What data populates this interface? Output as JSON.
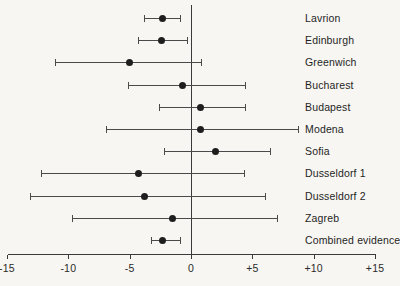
{
  "chart_data": {
    "type": "scatter",
    "subtype": "forest-plot",
    "title": "",
    "xlabel": "",
    "ylabel": "",
    "xlim": [
      -15,
      15
    ],
    "xticks": [
      -15,
      -10,
      -5,
      0,
      5,
      10,
      15
    ],
    "xtick_labels": [
      "-15",
      "-10",
      "-5",
      "0",
      "+5",
      "+10",
      "+15"
    ],
    "grid": false,
    "legend": null,
    "reference_line": 0,
    "categories": [
      "Lavrion",
      "Edinburgh",
      "Greenwich",
      "Bucharest",
      "Budapest",
      "Modena",
      "Sofia",
      "Dusseldorf 1",
      "Dusseldorf 2",
      "Zagreb",
      "Combined evidence"
    ],
    "points": [
      {
        "label": "Lavrion",
        "estimate": -2.3,
        "ci_low": -3.8,
        "ci_high": -0.9
      },
      {
        "label": "Edinburgh",
        "estimate": -2.4,
        "ci_low": -4.3,
        "ci_high": -0.3
      },
      {
        "label": "Greenwich",
        "estimate": -5.0,
        "ci_low": -11.1,
        "ci_high": 0.8
      },
      {
        "label": "Bucharest",
        "estimate": -0.7,
        "ci_low": -5.1,
        "ci_high": 4.4
      },
      {
        "label": "Budapest",
        "estimate": 0.8,
        "ci_low": -2.6,
        "ci_high": 4.4
      },
      {
        "label": "Modena",
        "estimate": 0.8,
        "ci_low": -6.9,
        "ci_high": 8.7
      },
      {
        "label": "Sofia",
        "estimate": 2.0,
        "ci_low": -2.2,
        "ci_high": 6.4
      },
      {
        "label": "Dusseldorf 1",
        "estimate": -4.3,
        "ci_low": -12.2,
        "ci_high": 4.3
      },
      {
        "label": "Dusseldorf 2",
        "estimate": -3.8,
        "ci_low": -13.1,
        "ci_high": 6.0
      },
      {
        "label": "Zagreb",
        "estimate": -1.5,
        "ci_low": -9.7,
        "ci_high": 7.0
      },
      {
        "label": "Combined evidence",
        "estimate": -2.3,
        "ci_low": -3.3,
        "ci_high": -0.9
      }
    ]
  },
  "colors": {
    "background": "#f7f6f2",
    "marker": "#1e1e1e",
    "whisker": "#4a4a4a",
    "axis": "#3a3a3a",
    "text": "#1f1f1f"
  }
}
